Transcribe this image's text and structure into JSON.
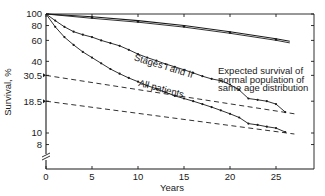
{
  "chart_data": {
    "type": "line",
    "title": "",
    "xlabel": "Years",
    "ylabel": "Survival, %",
    "xlim": [
      0,
      29
    ],
    "ylim": [
      6,
      100
    ],
    "yscale": "log",
    "x_ticks": [
      0,
      5,
      10,
      15,
      20,
      25
    ],
    "y_ticks": [
      100,
      80,
      60,
      40,
      30.5,
      18.5,
      10,
      8
    ],
    "y_tick_labels": [
      "100",
      "80",
      "60",
      "40",
      "30.5",
      "18.5",
      "10",
      "8"
    ],
    "axis_break": true,
    "grid": false,
    "annotations": [
      {
        "text": "Stages I and II",
        "x": 9.5,
        "y": 41
      },
      {
        "text": "All patients",
        "x": 10,
        "y": 25
      },
      {
        "text": "Expected survival of",
        "x": 18.7,
        "y": 31.5
      },
      {
        "text": "normal population of",
        "x": 18.7,
        "y": 26.5
      },
      {
        "text": "same age distribution",
        "x": 18.7,
        "y": 22.5
      }
    ],
    "series": [
      {
        "name": "Expected survival of normal population (Stages I and II)",
        "style": "solid-double",
        "x": [
          0,
          5,
          10,
          15,
          20,
          25,
          26.5
        ],
        "y": [
          100,
          95,
          88,
          80,
          71,
          62,
          59
        ]
      },
      {
        "name": "Stages I and II",
        "style": "solid-markers",
        "x": [
          0,
          1,
          2,
          3,
          4,
          5,
          6,
          7,
          8,
          9,
          10,
          11,
          12,
          13,
          14,
          15,
          16,
          17,
          18,
          19,
          20,
          21,
          22,
          23,
          24,
          25,
          26
        ],
        "y": [
          100,
          88,
          78,
          71,
          67,
          64,
          60,
          57,
          54,
          50,
          46,
          43,
          40.5,
          38,
          36,
          34,
          32,
          30,
          28.5,
          27.5,
          25.5,
          23,
          19.5,
          19,
          18.5,
          17.5,
          15
        ]
      },
      {
        "name": "All patients",
        "style": "solid-markers",
        "x": [
          0,
          1,
          2,
          3,
          4,
          5,
          6,
          7,
          8,
          9,
          10,
          11,
          12,
          13,
          14,
          15,
          16,
          17,
          18,
          19,
          20,
          21,
          22,
          23,
          24,
          25,
          26
        ],
        "y": [
          100,
          78,
          64,
          55,
          48,
          43,
          38.5,
          34.5,
          31.5,
          29,
          27,
          25,
          23.5,
          22,
          20.5,
          19.5,
          18.5,
          17.5,
          16.5,
          15.5,
          14.5,
          13.5,
          12,
          11.7,
          11.3,
          11,
          10.2
        ]
      },
      {
        "name": "Expected survival (Stages I and II, dashed)",
        "style": "dashed",
        "x": [
          0,
          27
        ],
        "y": [
          30.5,
          14.5
        ]
      },
      {
        "name": "Expected survival (All patients, dashed)",
        "style": "dashed",
        "x": [
          0,
          27
        ],
        "y": [
          18.5,
          9.8
        ]
      }
    ]
  }
}
